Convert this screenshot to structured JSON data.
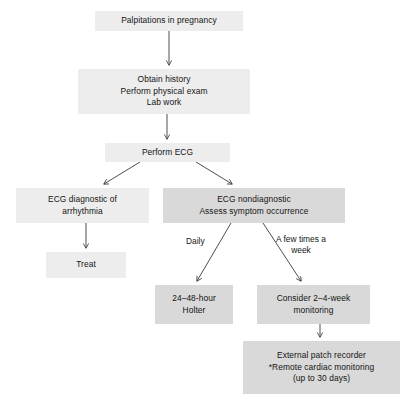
{
  "diagram": {
    "background_color": "#ffffff",
    "node_fill_light": "#ededed",
    "node_fill_dark": "#d9d9d9",
    "edge_color": "#3a3a3a",
    "text_color": "#141414"
  },
  "nodes": [
    {
      "id": "palpitations",
      "name": "palpitations-in-pregnancy",
      "lines": [
        "Palpitations in pregnancy"
      ],
      "fill": "#ededed",
      "x": 95,
      "y": 11,
      "w": 148,
      "h": 20
    },
    {
      "id": "workup",
      "name": "obtain-history-workup",
      "lines": [
        "Obtain history",
        "Perform physical exam",
        "Lab work"
      ],
      "fill": "#ededed",
      "x": 78,
      "y": 69,
      "w": 172,
      "h": 45
    },
    {
      "id": "ecg",
      "name": "perform-ecg",
      "lines": [
        "Perform ECG"
      ],
      "fill": "#ededed",
      "x": 105,
      "y": 143,
      "w": 125,
      "h": 19
    },
    {
      "id": "ecg-diagnostic",
      "name": "ecg-diagnostic-of-arrhythmia",
      "lines": [
        "ECG diagnostic of",
        "arrhythmia"
      ],
      "fill": "#ededed",
      "x": 16,
      "y": 188,
      "w": 133,
      "h": 35
    },
    {
      "id": "ecg-nondiagnostic",
      "name": "ecg-nondiagnostic-assess-symptoms",
      "lines": [
        "ECG nondiagnostic",
        "Assess symptom occurrence"
      ],
      "fill": "#d9d9d9",
      "x": 163,
      "y": 188,
      "w": 182,
      "h": 35
    },
    {
      "id": "treat",
      "name": "treat",
      "lines": [
        "Treat"
      ],
      "fill": "#ededed",
      "x": 46,
      "y": 252,
      "w": 80,
      "h": 26
    },
    {
      "id": "holter",
      "name": "24-48-hour-holter",
      "lines": [
        "24–48-hour",
        "Holter"
      ],
      "fill": "#d9d9d9",
      "x": 155,
      "y": 285,
      "w": 78,
      "h": 39
    },
    {
      "id": "consider-monitoring",
      "name": "consider-2-4-week-monitoring",
      "lines": [
        "Consider 2–4-week",
        "monitoring"
      ],
      "fill": "#d9d9d9",
      "x": 257,
      "y": 285,
      "w": 113,
      "h": 39
    },
    {
      "id": "patch-recorder",
      "name": "external-patch-recorder",
      "lines": [
        "External patch recorder",
        "*Remote cardiac monitoring",
        "(up to 30 days)"
      ],
      "fill": "#d9d9d9",
      "x": 243,
      "y": 341,
      "w": 157,
      "h": 53
    }
  ],
  "edge_labels": [
    {
      "id": "daily",
      "name": "edge-label-daily",
      "text": "Daily",
      "x": 186,
      "y": 236,
      "wrap": false
    },
    {
      "id": "a-few-times-a-week",
      "name": "edge-label-a-few-times-a-week",
      "text": "A few times a week",
      "x": 272,
      "y": 234,
      "wrap": true
    }
  ],
  "edges": [
    {
      "id": "palpitations-to-workup",
      "name": "edge-palpitations-to-workup",
      "from": "palpitations",
      "to": "workup"
    },
    {
      "id": "workup-to-ecg",
      "name": "edge-workup-to-ecg",
      "from": "workup",
      "to": "ecg"
    },
    {
      "id": "ecg-to-diagnostic",
      "name": "edge-ecg-to-diagnostic",
      "from": "ecg",
      "to": "ecg-diagnostic"
    },
    {
      "id": "ecg-to-nondiagnostic",
      "name": "edge-ecg-to-nondiagnostic",
      "from": "ecg",
      "to": "ecg-nondiagnostic"
    },
    {
      "id": "diagnostic-to-treat",
      "name": "edge-diagnostic-to-treat",
      "from": "ecg-diagnostic",
      "to": "treat"
    },
    {
      "id": "nondiagnostic-to-holter",
      "name": "edge-nondiagnostic-to-holter",
      "from": "ecg-nondiagnostic",
      "to": "holter",
      "label": "Daily"
    },
    {
      "id": "nondiagnostic-to-consider",
      "name": "edge-nondiagnostic-to-consider",
      "from": "ecg-nondiagnostic",
      "to": "consider-monitoring",
      "label": "A few times a week"
    },
    {
      "id": "consider-to-patch",
      "name": "edge-consider-to-patch",
      "from": "consider-monitoring",
      "to": "patch-recorder"
    }
  ]
}
